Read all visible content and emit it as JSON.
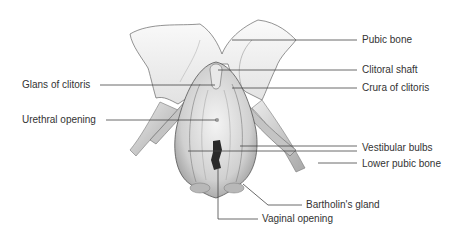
{
  "diagram": {
    "labels": {
      "pubic_bone": "Pubic bone",
      "clitoral_shaft": "Clitoral shaft",
      "crura": "Crura of clitoris",
      "glans": "Glans of clitoris",
      "urethral_opening": "Urethral opening",
      "vestibular_bulbs": "Vestibular bulbs",
      "lower_pubic_bone": "Lower pubic bone",
      "bartholins_gland": "Bartholin's gland",
      "vaginal_opening": "Vaginal opening"
    },
    "colors": {
      "line": "#444444",
      "text": "#333333",
      "bone": "#f2f2f2",
      "tissue": "#d6d6d6",
      "shadow": "#9a9a9a",
      "opening": "#2a2a2a"
    }
  }
}
